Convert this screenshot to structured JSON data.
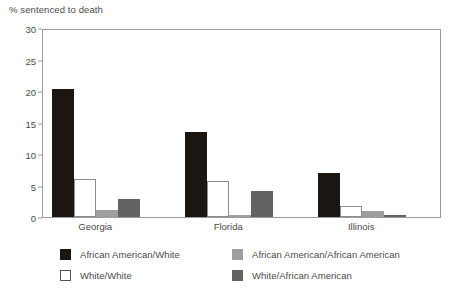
{
  "chart_data": {
    "type": "bar",
    "title": "% sentenced to death",
    "xlabel": "",
    "ylabel": "% sentenced to death",
    "ylim": [
      0,
      30
    ],
    "yticks": [
      0,
      5,
      10,
      15,
      20,
      25,
      30
    ],
    "ytick_labels": [
      "0",
      "5",
      "10",
      "15",
      "20",
      "25",
      "30"
    ],
    "grid": false,
    "legend_position": "bottom",
    "categories": [
      "Georgia",
      "Florida",
      "Illinois"
    ],
    "series": [
      {
        "name": "African American/White",
        "color": "#1c1613",
        "values": [
          20.3,
          13.5,
          7.0
        ]
      },
      {
        "name": "White/White",
        "color": "#ffffff",
        "values": [
          6.0,
          5.7,
          1.7
        ]
      },
      {
        "name": "African American/African American",
        "color": "#9e9e9e",
        "values": [
          1.1,
          0.3,
          0.9
        ]
      },
      {
        "name": "White/African American",
        "color": "#636363",
        "values": [
          2.8,
          4.1,
          0.3
        ]
      }
    ]
  }
}
